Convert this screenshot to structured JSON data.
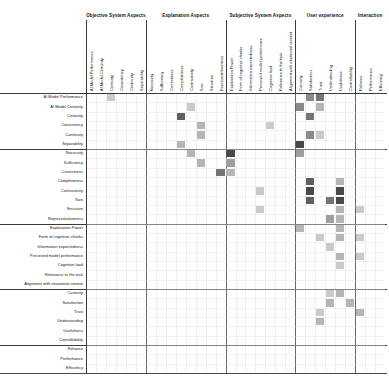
{
  "figure": {
    "type": "matrix-heatmap",
    "background": "#ffffff",
    "grid_line_color": "#3a3a3a",
    "cell_base_color": "#000000"
  },
  "groups": {
    "columns": [
      {
        "label": "Objective System Aspects",
        "count": 6
      },
      {
        "label": "Explanation Aspects",
        "count": 8
      },
      {
        "label": "Subjective System Aspects",
        "count": 7
      },
      {
        "label": "User experience",
        "count": 6
      },
      {
        "label": "Interaction",
        "count": 3
      }
    ],
    "rows": [
      {
        "label": "Objective System Aspects",
        "count": 6
      },
      {
        "label": "Explanation Aspects",
        "count": 8
      },
      {
        "label": "Subjective System Aspects",
        "count": 7
      },
      {
        "label": "User experience",
        "count": 6
      },
      {
        "label": "Interaction",
        "count": 3
      }
    ]
  },
  "chart_data": {
    "type": "heatmap",
    "title": "",
    "subtitle": "",
    "xlabel": "",
    "ylabel": "",
    "grid": true,
    "legend": "none",
    "colormap": "greys",
    "value_range": [
      0,
      10
    ],
    "categories": [
      "AI Model Performance",
      "AI Model Certainty",
      "Certainty",
      "Consistency",
      "Continuity",
      "Separability",
      "Necessity",
      "Sufficiency",
      "Correctness",
      "Completeness",
      "Contrastivity",
      "Size",
      "Structure",
      "Representativeness",
      "Explanation Power",
      "Form of cognitive chunks",
      "Information expectedness",
      "Perceived model performance",
      "Cognitive load",
      "Relevance to the task",
      "Alignment with situational context",
      "Curiosity",
      "Satisfaction",
      "Trust",
      "Understanding",
      "Usefulness",
      "Controllability",
      "Reliance",
      "Performance",
      "Efficiency"
    ],
    "x": [
      "AI Model Performance",
      "AI Model Certainty",
      "Certainty",
      "Consistency",
      "Continuity",
      "Separability",
      "Necessity",
      "Sufficiency",
      "Correctness",
      "Completeness",
      "Contrastivity",
      "Size",
      "Structure",
      "Representativeness",
      "Explanation Power",
      "Form of cognitive chunks",
      "Information expectedness",
      "Perceived model performance",
      "Cognitive load",
      "Relevance to the task",
      "Alignment with situational context",
      "Curiosity",
      "Satisfaction",
      "Trust",
      "Understanding",
      "Usefulness",
      "Controllability",
      "Reliance",
      "Performance",
      "Efficiency"
    ],
    "y": [
      "AI Model Performance",
      "AI Model Certainty",
      "Certainty",
      "Consistency",
      "Continuity",
      "Separability",
      "Necessity",
      "Sufficiency",
      "Correctness",
      "Completeness",
      "Contrastivity",
      "Size",
      "Structure",
      "Representativeness",
      "Explanation Power",
      "Form of cognitive chunks",
      "Information expectedness",
      "Perceived model performance",
      "Cognitive load",
      "Relevance to the task",
      "Alignment with situational context",
      "Curiosity",
      "Satisfaction",
      "Trust",
      "Understanding",
      "Usefulness",
      "Controllability",
      "Reliance",
      "Performance",
      "Efficiency"
    ],
    "cells": [
      {
        "row": 0,
        "col": 2,
        "value": 2
      },
      {
        "row": 0,
        "col": 22,
        "value": 5
      },
      {
        "row": 0,
        "col": 23,
        "value": 6
      },
      {
        "row": 1,
        "col": 10,
        "value": 2
      },
      {
        "row": 1,
        "col": 21,
        "value": 5
      },
      {
        "row": 1,
        "col": 23,
        "value": 3
      },
      {
        "row": 2,
        "col": 9,
        "value": 7
      },
      {
        "row": 2,
        "col": 22,
        "value": 6
      },
      {
        "row": 3,
        "col": 11,
        "value": 3
      },
      {
        "row": 3,
        "col": 18,
        "value": 2
      },
      {
        "row": 4,
        "col": 11,
        "value": 3
      },
      {
        "row": 4,
        "col": 22,
        "value": 5
      },
      {
        "row": 4,
        "col": 23,
        "value": 2
      },
      {
        "row": 5,
        "col": 9,
        "value": 3
      },
      {
        "row": 5,
        "col": 21,
        "value": 8
      },
      {
        "row": 6,
        "col": 10,
        "value": 3
      },
      {
        "row": 6,
        "col": 14,
        "value": 8
      },
      {
        "row": 6,
        "col": 21,
        "value": 4
      },
      {
        "row": 7,
        "col": 11,
        "value": 3
      },
      {
        "row": 7,
        "col": 14,
        "value": 4
      },
      {
        "row": 8,
        "col": 13,
        "value": 6
      },
      {
        "row": 8,
        "col": 14,
        "value": 3
      },
      {
        "row": 9,
        "col": 22,
        "value": 7
      },
      {
        "row": 9,
        "col": 25,
        "value": 3
      },
      {
        "row": 10,
        "col": 17,
        "value": 2
      },
      {
        "row": 10,
        "col": 22,
        "value": 8
      },
      {
        "row": 10,
        "col": 25,
        "value": 8
      },
      {
        "row": 11,
        "col": 22,
        "value": 7
      },
      {
        "row": 11,
        "col": 24,
        "value": 6
      },
      {
        "row": 11,
        "col": 25,
        "value": 8
      },
      {
        "row": 12,
        "col": 17,
        "value": 2
      },
      {
        "row": 12,
        "col": 25,
        "value": 3
      },
      {
        "row": 12,
        "col": 27,
        "value": 2
      },
      {
        "row": 13,
        "col": 24,
        "value": 4
      },
      {
        "row": 13,
        "col": 25,
        "value": 3
      },
      {
        "row": 14,
        "col": 21,
        "value": 3
      },
      {
        "row": 14,
        "col": 25,
        "value": 3
      },
      {
        "row": 15,
        "col": 23,
        "value": 2
      },
      {
        "row": 15,
        "col": 25,
        "value": 3
      },
      {
        "row": 15,
        "col": 27,
        "value": 2
      },
      {
        "row": 16,
        "col": 24,
        "value": 2
      },
      {
        "row": 17,
        "col": 25,
        "value": 3
      },
      {
        "row": 17,
        "col": 27,
        "value": 2
      },
      {
        "row": 18,
        "col": 25,
        "value": 2
      },
      {
        "row": 21,
        "col": 24,
        "value": 2
      },
      {
        "row": 21,
        "col": 25,
        "value": 3
      },
      {
        "row": 22,
        "col": 24,
        "value": 3
      },
      {
        "row": 22,
        "col": 26,
        "value": 3
      },
      {
        "row": 23,
        "col": 23,
        "value": 2
      },
      {
        "row": 23,
        "col": 27,
        "value": 3
      },
      {
        "row": 24,
        "col": 23,
        "value": 3
      }
    ]
  },
  "axes": {
    "has_baseline": true,
    "has_left_axis": true
  }
}
